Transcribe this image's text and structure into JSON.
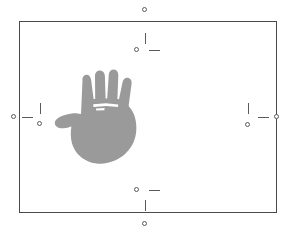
{
  "figure": {
    "background_color": "#ffffff",
    "frame": {
      "name": "bounding-frame",
      "stroke_color": "#4a4a4a",
      "stroke_width": 1,
      "x": 19,
      "y": 21,
      "width": 258,
      "height": 192
    },
    "subject": {
      "name": "hand-silhouette",
      "description": "grey filled hand, palm facing forward, fingers up, thumb extended to the left",
      "fill_color": "#9a9a9a",
      "gap_color": "#ffffff",
      "x": 60,
      "y": 72,
      "width": 78,
      "height": 92
    },
    "markers": [
      {
        "name": "marker-top",
        "edge": "top",
        "edge_circle": {
          "cx": 145,
          "cy": 10
        },
        "tick": {
          "orientation": "vertical",
          "x": 145,
          "y": 33,
          "length": 11
        },
        "inner_circle": {
          "cx": 137,
          "cy": 50
        },
        "dash": {
          "orientation": "horizontal",
          "x": 149,
          "y": 50,
          "length": 11
        }
      },
      {
        "name": "marker-bottom",
        "edge": "bottom",
        "edge_circle": {
          "cx": 145,
          "cy": 224
        },
        "tick": {
          "orientation": "vertical",
          "x": 145,
          "y": 200,
          "length": 11
        },
        "inner_circle": {
          "cx": 137,
          "cy": 190
        },
        "dash": {
          "orientation": "horizontal",
          "x": 149,
          "y": 190,
          "length": 11
        }
      },
      {
        "name": "marker-left",
        "edge": "left",
        "edge_circle": {
          "cx": 14,
          "cy": 117
        },
        "tick": {
          "orientation": "vertical",
          "x": 40,
          "y": 103,
          "length": 11
        },
        "inner_circle": {
          "cx": 40,
          "cy": 124
        },
        "dash": {
          "orientation": "horizontal",
          "x": 22,
          "y": 117,
          "length": 11
        }
      },
      {
        "name": "marker-right",
        "edge": "right",
        "edge_circle": {
          "cx": 277,
          "cy": 117
        },
        "tick": {
          "orientation": "vertical",
          "x": 248,
          "y": 103,
          "length": 11
        },
        "inner_circle": {
          "cx": 248,
          "cy": 125
        },
        "dash": {
          "orientation": "horizontal",
          "x": 258,
          "y": 117,
          "length": 11
        }
      }
    ],
    "colors": {
      "frame_stroke": "#4a4a4a",
      "marker_stroke": "#5a5a5a",
      "hand_fill": "#9a9a9a",
      "background": "#ffffff"
    }
  }
}
